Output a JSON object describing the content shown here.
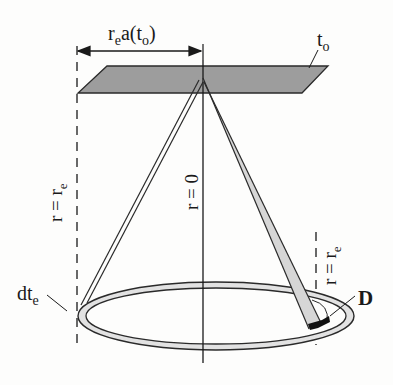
{
  "diagram": {
    "type": "geometric-schematic",
    "labels": {
      "top_dimension": {
        "base": "r",
        "sub": "e",
        "rest": "a(t",
        "sub2": "o",
        "close": ")"
      },
      "plane": {
        "base": "t",
        "sub": "o"
      },
      "left_axis": {
        "base": "r = r",
        "sub": "e"
      },
      "center_axis": {
        "text": "r = 0"
      },
      "right_axis": {
        "base": "r = r",
        "sub": "e"
      },
      "ring_left": {
        "base": "dt",
        "sub": "e"
      },
      "detector": {
        "text": "D"
      }
    },
    "colors": {
      "line": "#2a2a2a",
      "plane_fill": "#9a9a9a",
      "ring_fill": "#e2e2e2",
      "beam_fill": "#d6d6d6",
      "detector_fill": "#111111"
    }
  }
}
